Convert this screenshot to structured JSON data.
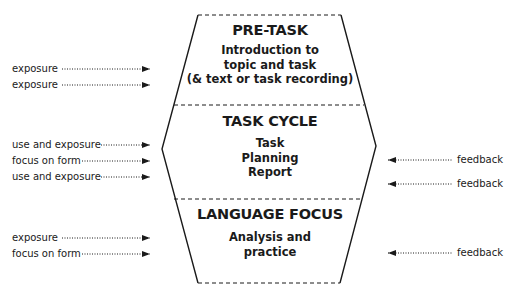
{
  "diagram": {
    "type": "task-based learning framework",
    "sections": [
      {
        "id": "pre-task",
        "title": "PRE-TASK",
        "lines": [
          "Introduction to",
          "topic and task",
          "(& text or task recording)"
        ]
      },
      {
        "id": "task-cycle",
        "title": "TASK CYCLE",
        "lines": [
          "Task",
          "Planning",
          "Report"
        ]
      },
      {
        "id": "language-focus",
        "title": "LANGUAGE FOCUS",
        "lines": [
          "Analysis and",
          "practice"
        ]
      }
    ],
    "inputs": [
      {
        "label": "exposure",
        "section": "pre-task"
      },
      {
        "label": "exposure",
        "section": "pre-task"
      },
      {
        "label": "use and exposure",
        "section": "task-cycle"
      },
      {
        "label": "focus on form",
        "section": "task-cycle"
      },
      {
        "label": "use and exposure",
        "section": "task-cycle"
      },
      {
        "label": "exposure",
        "section": "language-focus"
      },
      {
        "label": "focus on form",
        "section": "language-focus"
      }
    ],
    "outputs": [
      {
        "label": "feedback",
        "section": "task-cycle"
      },
      {
        "label": "feedback",
        "section": "task-cycle"
      },
      {
        "label": "feedback",
        "section": "language-focus"
      }
    ],
    "colors": {
      "line": "#1a1a1a",
      "background": "#ffffff"
    }
  }
}
